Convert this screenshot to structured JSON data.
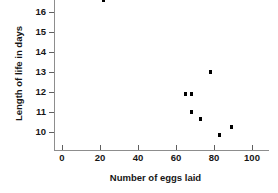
{
  "chart_data": {
    "type": "scatter",
    "title": "",
    "xlabel": "Number of eggs laid",
    "ylabel": "Length of life in days",
    "xlim": [
      0,
      113
    ],
    "ylim": [
      9.3,
      16.8
    ],
    "grid": false,
    "legend": null,
    "xticks": [
      0,
      20,
      40,
      60,
      80,
      100
    ],
    "xtick_labels": [
      "0",
      "20",
      "40",
      "60",
      "80",
      "100"
    ],
    "yticks": [
      10,
      11,
      12,
      13,
      14,
      15,
      16
    ],
    "ytick_labels": [
      "10",
      "11",
      "12",
      "13",
      "14",
      "15",
      "16"
    ],
    "marker": "square",
    "marker_color": "#000000",
    "points": [
      {
        "x": 22,
        "y": 16.6
      },
      {
        "x": 65,
        "y": 11.9
      },
      {
        "x": 68,
        "y": 11.9
      },
      {
        "x": 78,
        "y": 13.0
      },
      {
        "x": 68,
        "y": 11.0
      },
      {
        "x": 73,
        "y": 10.65
      },
      {
        "x": 83,
        "y": 9.85
      },
      {
        "x": 89,
        "y": 10.25
      }
    ]
  },
  "axes": {
    "y_label": "Length of life in days",
    "x_label": "Number of eggs laid",
    "y_tick_0": "16",
    "y_tick_1": "15",
    "y_tick_2": "14",
    "y_tick_3": "13",
    "y_tick_4": "12",
    "y_tick_5": "11",
    "y_tick_6": "10",
    "x_tick_0": "0",
    "x_tick_1": "20",
    "x_tick_2": "40",
    "x_tick_3": "60",
    "x_tick_4": "80",
    "x_tick_5": "100"
  }
}
